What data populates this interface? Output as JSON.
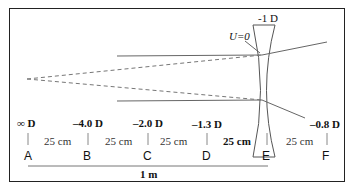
{
  "lens": {
    "power_label": "-1 D",
    "annotation": "U=0"
  },
  "points": [
    {
      "id": "A",
      "power": "∞ D",
      "x": 24
    },
    {
      "id": "B",
      "power": "–4.0 D",
      "x": 86
    },
    {
      "id": "C",
      "power": "–2.0 D",
      "x": 147
    },
    {
      "id": "D",
      "power": "–1.3 D",
      "x": 207
    },
    {
      "id": "E",
      "power": "",
      "x": 264
    },
    {
      "id": "F",
      "power": "–0.8 D",
      "x": 327
    }
  ],
  "distances": [
    "25 cm",
    "25 cm",
    "25 cm",
    "25 cm",
    "25 cm"
  ],
  "total_span": "1 m",
  "colors": {
    "line": "#555555",
    "text": "#111111",
    "frame": "#222222"
  }
}
